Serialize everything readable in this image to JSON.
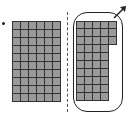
{
  "figure": {
    "label_marker": "bullet",
    "left_grid": {
      "rows": 10,
      "cols": 6,
      "row_lengths": [
        6,
        6,
        6,
        6,
        6,
        6,
        6,
        6,
        6,
        6
      ],
      "cell_color": "#9a9a9a",
      "total_cells": 60
    },
    "divider": {
      "style": "dashed"
    },
    "right_grid": {
      "rows": 10,
      "row_lengths": [
        5,
        5,
        5,
        4,
        4,
        4,
        4,
        4,
        4,
        4
      ],
      "cell_color": "#9a9a9a",
      "total_cells": 43,
      "enclosed": true
    },
    "enclosure": {
      "shape": "rounded-rectangle",
      "arrow": "up-right"
    },
    "colors": {
      "cell": "#9a9a9a",
      "line": "#333333",
      "outline": "#222222"
    }
  }
}
